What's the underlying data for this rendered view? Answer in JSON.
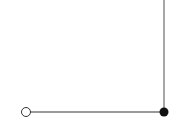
{
  "diagram": {
    "width": 187,
    "height": 140,
    "colors": {
      "line": "#777777",
      "open_node_fill": "#ffffff",
      "open_node_stroke": "#333333",
      "filled_node": "#111111",
      "background": "#ffffff"
    },
    "nodes": [
      {
        "id": "start",
        "type": "open-circle",
        "cx": 26,
        "cy": 112,
        "r": 4.5
      },
      {
        "id": "corner",
        "type": "filled-circle",
        "cx": 164,
        "cy": 112,
        "r": 4.5
      }
    ],
    "edges": [
      {
        "id": "horizontal",
        "x1": 30.5,
        "y1": 112,
        "x2": 164,
        "y2": 112
      },
      {
        "id": "vertical",
        "x1": 164,
        "y1": 0,
        "x2": 164,
        "y2": 112
      }
    ]
  }
}
